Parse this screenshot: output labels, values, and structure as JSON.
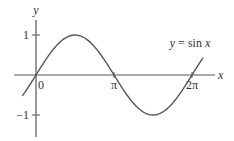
{
  "chart_data": {
    "type": "line",
    "title": "",
    "xlabel": "x",
    "ylabel": "y",
    "function": "sin",
    "annotation": "y = sin x",
    "xlim": [
      -0.9,
      7.0
    ],
    "ylim": [
      -1.5,
      1.4
    ],
    "x_domain": [
      -0.55,
      6.73
    ],
    "x_ticks": [
      {
        "value": 0,
        "label": "0"
      },
      {
        "value": 3.14159,
        "label": "π"
      },
      {
        "value": 6.28318,
        "label": "2π"
      }
    ],
    "y_ticks": [
      {
        "value": 1,
        "label": "1"
      },
      {
        "value": -1,
        "label": "−1"
      }
    ],
    "grid": false,
    "legend": "none",
    "series": [
      {
        "name": "y = sin x",
        "color": "#555555"
      }
    ]
  }
}
